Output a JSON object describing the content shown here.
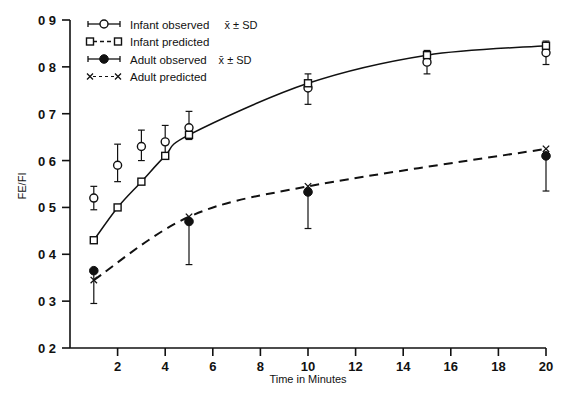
{
  "chart_data": {
    "type": "line",
    "title": "",
    "xlabel": "Time in Minutes",
    "ylabel": "FE/FI",
    "xlim": [
      0,
      20
    ],
    "ylim": [
      0.2,
      0.9
    ],
    "xticks": [
      2,
      4,
      6,
      8,
      10,
      12,
      14,
      16,
      18,
      20
    ],
    "xtick_labels": [
      "2",
      "4",
      "6",
      "8",
      "10",
      "12",
      "14",
      "16",
      "18",
      "20"
    ],
    "yticks": [
      0.2,
      0.3,
      0.4,
      0.5,
      0.6,
      0.7,
      0.8,
      0.9
    ],
    "ytick_labels": [
      "0 2",
      "0 3",
      "0 4",
      "0 5",
      "0 6",
      "0 7",
      "0 8",
      "0 9"
    ],
    "grid": false,
    "legend_position": "top-left",
    "series": [
      {
        "name": "Infant observed x̄ ± SD",
        "marker": "open-circle",
        "line": "none",
        "x": [
          1,
          2,
          3,
          4,
          5,
          10,
          15,
          20
        ],
        "values": [
          0.52,
          0.59,
          0.63,
          0.64,
          0.67,
          0.755,
          0.81,
          0.83
        ],
        "err_low": [
          0.495,
          0.555,
          0.6,
          0.615,
          0.645,
          0.72,
          0.785,
          0.805
        ],
        "err_high": [
          0.545,
          0.635,
          0.665,
          0.675,
          0.705,
          0.785,
          0.835,
          0.855
        ]
      },
      {
        "name": "Infant predicted",
        "marker": "open-square",
        "line": "solid-curve",
        "x": [
          1,
          2,
          3,
          4,
          5,
          10,
          15,
          20
        ],
        "values": [
          0.43,
          0.5,
          0.555,
          0.61,
          0.655,
          0.765,
          0.825,
          0.845
        ]
      },
      {
        "name": "Adult observed x̄ ± SD",
        "marker": "filled-circle",
        "line": "none",
        "x": [
          1,
          5,
          10,
          20
        ],
        "values": [
          0.365,
          0.47,
          0.533,
          0.61
        ],
        "err_low": [
          0.295,
          0.378,
          0.455,
          0.535
        ],
        "err_high": [
          0.365,
          0.47,
          0.533,
          0.61
        ]
      },
      {
        "name": "Adult predicted",
        "marker": "x-mark",
        "line": "dashed-curve",
        "x": [
          1,
          5,
          10,
          20
        ],
        "values": [
          0.345,
          0.48,
          0.545,
          0.625
        ]
      }
    ]
  },
  "legend": {
    "items": [
      {
        "label": "Infant observed",
        "suffix": "x̄ ± SD",
        "marker": "open-circle-errorbar"
      },
      {
        "label": "Infant predicted",
        "suffix": "",
        "marker": "open-square-dashed"
      },
      {
        "label": "Adult observed",
        "suffix": "x̄ ± SD",
        "marker": "filled-circle-errorbar"
      },
      {
        "label": "Adult predicted",
        "suffix": "",
        "marker": "x-dotted"
      }
    ]
  },
  "axes": {
    "y_title": "FE/FI",
    "x_title": "Time in Minutes"
  },
  "colors": {
    "ink": "#111111",
    "background": "#ffffff"
  }
}
